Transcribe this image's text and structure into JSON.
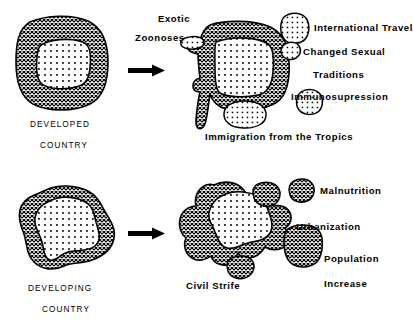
{
  "figure": {
    "title_present": false,
    "background_color": "#ffffff",
    "ink_color": "#000000",
    "rows": [
      {
        "id": "developed",
        "source_caption_line1": "DEVELOPED",
        "source_caption_line2": "COUNTRY",
        "arrow": "right-arrow",
        "factors": [
          "Exotic",
          "Zoonoses",
          "International Travel",
          "Changed Sexual",
          "Traditions",
          "Immunosupression",
          "Immigration from the Tropics"
        ]
      },
      {
        "id": "developing",
        "source_caption_line1": "DEVELOPING",
        "source_caption_line2": "COUNTRY",
        "arrow": "right-arrow",
        "factors": [
          "Malnutrition",
          "Urbanization",
          "Population",
          "Increase",
          "Civil Strife"
        ]
      }
    ]
  },
  "labels": {
    "developed_country_line1": "DEVELOPED",
    "developed_country_line2": "COUNTRY",
    "developing_country_line1": "DEVELOPING",
    "developing_country_line2": "COUNTRY",
    "exotic": "Exotic",
    "zoonoses": "Zoonoses",
    "international_travel": "International Travel",
    "changed_sexual": "Changed Sexual",
    "traditions": "Traditions",
    "immunosupression": "Immunosupression",
    "immigration_from_the_tropics": "Immigration from the Tropics",
    "malnutrition": "Malnutrition",
    "urbanization": "Urbanization",
    "population": "Population",
    "increase": "Increase",
    "civil_strife": "Civil Strife"
  },
  "shapes": {
    "developed_blob": "rounded-square-blob",
    "developed_result_blob": "rounded-square-blob-distorted",
    "developing_blob": "irregular-blob",
    "developing_result_blob": "irregular-blob-distorted",
    "satellites_top": [
      "international-travel-blob",
      "changed-sexual-blob",
      "immunosupression-blob",
      "immigration-blob",
      "zoonoses-blob"
    ],
    "satellites_bottom": [
      "malnutrition-blob",
      "population-increase-blob",
      "civil-strife-blob",
      "urbanization-blob"
    ]
  }
}
